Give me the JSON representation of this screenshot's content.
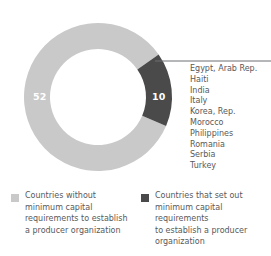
{
  "chart_data": {
    "type": "pie",
    "variant": "donut",
    "title": "",
    "categories": [
      "Countries without minimum capital requirements to establish a producer organization",
      "Countries that set out minimum capital requirements to establish a producer organization"
    ],
    "values": [
      52,
      10
    ],
    "total": 62,
    "value_labels": [
      "52",
      "10"
    ],
    "colors": [
      "#c9c9c9",
      "#4a4a4a"
    ],
    "legend_position": "bottom",
    "grid": false,
    "xlabel": "",
    "ylabel": "",
    "annotation_list_title": "",
    "annotation_items": [
      "Egypt, Arab Rep.",
      "Haiti",
      "India",
      "Italy",
      "Korea, Rep.",
      "Morocco",
      "Philippines",
      "Romania",
      "Serbia",
      "Turkey"
    ]
  },
  "donut": {
    "center_x": 98,
    "center_y": 97,
    "outer_radius": 74,
    "inner_radius": 48,
    "start_angle_deg": 55,
    "major_value": "52",
    "minor_value": "10"
  },
  "leader_line": {
    "color": "#6d6e71"
  },
  "countries": [
    "Egypt, Arab Rep.",
    "Haiti",
    "India",
    "Italy",
    "Korea, Rep.",
    "Morocco",
    "Philippines",
    "Romania",
    "Serbia",
    "Turkey"
  ],
  "legend": {
    "entries": [
      {
        "color": "#c9c9c9",
        "label": "Countries without minimum capital requirements to establish a producer organization"
      },
      {
        "color": "#4a4a4a",
        "label": "Countries that set out minimum capital requirements\nto establish a producer organization"
      }
    ]
  },
  "colors": {
    "major_slice": "#c9c9c9",
    "minor_slice": "#4a4a4a",
    "text": "#58595b",
    "value_text": "#ffffff",
    "background": "#ffffff"
  }
}
